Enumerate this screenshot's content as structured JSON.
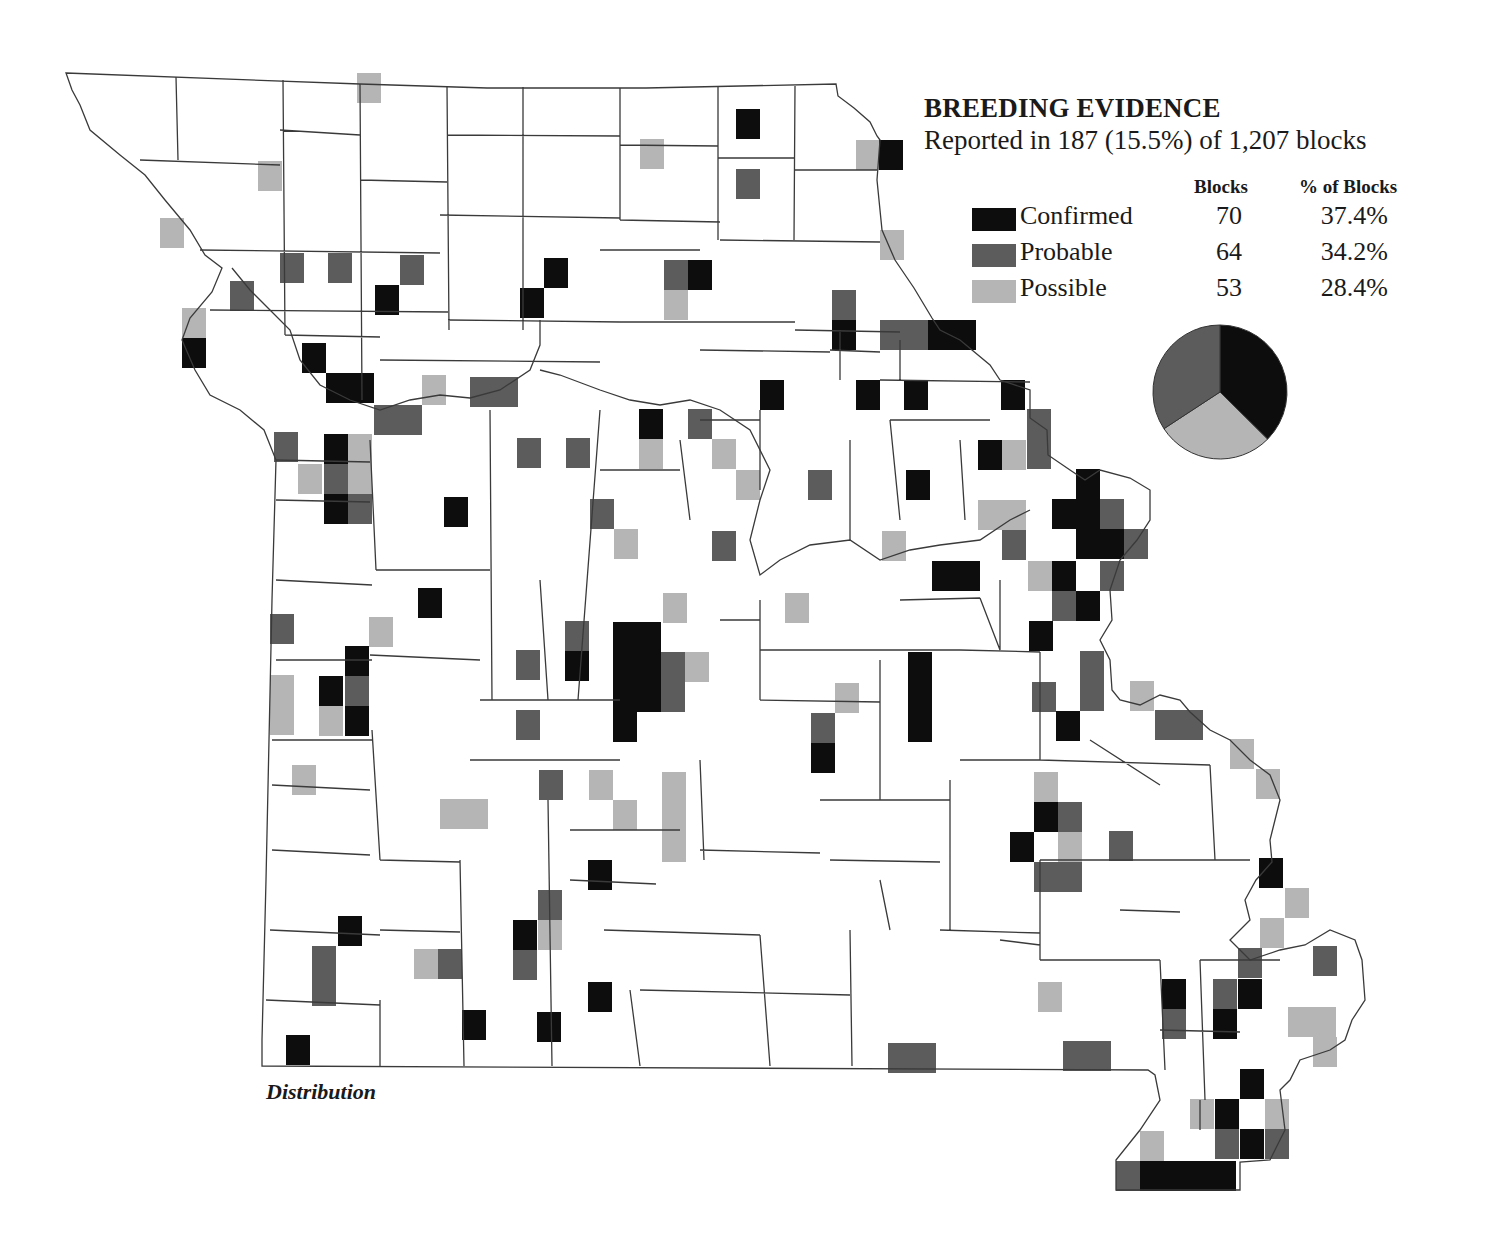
{
  "legend": {
    "title": "BREEDING EVIDENCE",
    "subtitle": "Reported in 187 (15.5%) of 1,207 blocks",
    "col_blocks": "Blocks",
    "col_pct": "% of Blocks",
    "rows": [
      {
        "label": "Confirmed",
        "blocks": "70",
        "pct": "37.4%",
        "color": "#0d0d0d"
      },
      {
        "label": "Probable",
        "blocks": "64",
        "pct": "34.2%",
        "color": "#5c5c5c"
      },
      {
        "label": "Possible",
        "blocks": "53",
        "pct": "28.4%",
        "color": "#b5b5b5"
      }
    ]
  },
  "caption": "Distribution",
  "colors": {
    "confirmed": "#0d0d0d",
    "probable": "#5c5c5c",
    "possible": "#b5b5b5",
    "border": "#3a3a3a"
  },
  "chart_data": {
    "type": "pie",
    "title": "BREEDING EVIDENCE",
    "subtitle": "Reported in 187 (15.5%) of 1,207 blocks",
    "categories": [
      "Confirmed",
      "Probable",
      "Possible"
    ],
    "values": [
      70,
      64,
      53
    ],
    "percentages": [
      37.4,
      34.2,
      28.4
    ],
    "total_blocks_reported": 187,
    "total_blocks": 1207
  },
  "blocks": [
    [
      357,
      73,
      24,
      30,
      "s"
    ],
    [
      736,
      109,
      24,
      30,
      "c"
    ],
    [
      736,
      169,
      24,
      30,
      "p"
    ],
    [
      640,
      139,
      24,
      30,
      "s"
    ],
    [
      856,
      140,
      24,
      30,
      "s"
    ],
    [
      879,
      140,
      24,
      30,
      "c"
    ],
    [
      258,
      161,
      24,
      30,
      "s"
    ],
    [
      160,
      218,
      24,
      30,
      "s"
    ],
    [
      880,
      230,
      24,
      30,
      "s"
    ],
    [
      280,
      253,
      24,
      30,
      "p"
    ],
    [
      328,
      253,
      24,
      30,
      "p"
    ],
    [
      400,
      255,
      24,
      30,
      "p"
    ],
    [
      230,
      281,
      24,
      30,
      "p"
    ],
    [
      375,
      285,
      24,
      30,
      "c"
    ],
    [
      544,
      258,
      24,
      30,
      "c"
    ],
    [
      520,
      288,
      24,
      30,
      "c"
    ],
    [
      664,
      260,
      24,
      30,
      "p"
    ],
    [
      688,
      260,
      24,
      30,
      "c"
    ],
    [
      664,
      290,
      24,
      30,
      "s"
    ],
    [
      832,
      290,
      24,
      30,
      "p"
    ],
    [
      832,
      320,
      24,
      30,
      "c"
    ],
    [
      880,
      320,
      48,
      30,
      "p"
    ],
    [
      928,
      320,
      48,
      30,
      "c"
    ],
    [
      182,
      308,
      24,
      30,
      "s"
    ],
    [
      182,
      338,
      24,
      30,
      "c"
    ],
    [
      302,
      343,
      24,
      30,
      "c"
    ],
    [
      326,
      373,
      48,
      30,
      "c"
    ],
    [
      422,
      375,
      24,
      30,
      "s"
    ],
    [
      470,
      377,
      48,
      30,
      "p"
    ],
    [
      374,
      405,
      48,
      30,
      "p"
    ],
    [
      760,
      380,
      24,
      30,
      "c"
    ],
    [
      856,
      380,
      24,
      30,
      "c"
    ],
    [
      904,
      380,
      24,
      30,
      "c"
    ],
    [
      1001,
      380,
      24,
      30,
      "c"
    ],
    [
      274,
      432,
      24,
      30,
      "p"
    ],
    [
      324,
      434,
      24,
      30,
      "c"
    ],
    [
      348,
      434,
      24,
      30,
      "s"
    ],
    [
      298,
      464,
      24,
      30,
      "s"
    ],
    [
      324,
      464,
      24,
      30,
      "p"
    ],
    [
      348,
      464,
      24,
      30,
      "s"
    ],
    [
      324,
      494,
      24,
      30,
      "c"
    ],
    [
      348,
      494,
      24,
      30,
      "p"
    ],
    [
      517,
      438,
      24,
      30,
      "p"
    ],
    [
      566,
      438,
      24,
      30,
      "p"
    ],
    [
      639,
      409,
      24,
      30,
      "c"
    ],
    [
      639,
      439,
      24,
      30,
      "s"
    ],
    [
      688,
      409,
      24,
      30,
      "p"
    ],
    [
      712,
      439,
      24,
      30,
      "s"
    ],
    [
      736,
      470,
      24,
      30,
      "s"
    ],
    [
      808,
      470,
      24,
      30,
      "p"
    ],
    [
      1027,
      409,
      24,
      60,
      "p"
    ],
    [
      978,
      440,
      24,
      30,
      "c"
    ],
    [
      1002,
      440,
      24,
      30,
      "s"
    ],
    [
      444,
      497,
      24,
      30,
      "c"
    ],
    [
      590,
      499,
      24,
      30,
      "p"
    ],
    [
      614,
      529,
      24,
      30,
      "s"
    ],
    [
      712,
      531,
      24,
      30,
      "p"
    ],
    [
      906,
      470,
      24,
      30,
      "c"
    ],
    [
      978,
      500,
      48,
      30,
      "s"
    ],
    [
      1002,
      530,
      24,
      30,
      "p"
    ],
    [
      882,
      531,
      24,
      30,
      "s"
    ],
    [
      932,
      561,
      48,
      30,
      "c"
    ],
    [
      1076,
      469,
      24,
      30,
      "c"
    ],
    [
      1052,
      499,
      48,
      30,
      "c"
    ],
    [
      1100,
      499,
      24,
      30,
      "p"
    ],
    [
      1076,
      529,
      48,
      30,
      "c"
    ],
    [
      1124,
      529,
      24,
      30,
      "p"
    ],
    [
      1028,
      561,
      24,
      30,
      "s"
    ],
    [
      1052,
      561,
      24,
      30,
      "c"
    ],
    [
      1100,
      561,
      24,
      30,
      "p"
    ],
    [
      1052,
      591,
      24,
      30,
      "p"
    ],
    [
      1076,
      591,
      24,
      30,
      "c"
    ],
    [
      1029,
      621,
      24,
      30,
      "c"
    ],
    [
      785,
      593,
      24,
      30,
      "s"
    ],
    [
      418,
      588,
      24,
      30,
      "c"
    ],
    [
      270,
      614,
      24,
      30,
      "p"
    ],
    [
      369,
      617,
      24,
      30,
      "s"
    ],
    [
      663,
      593,
      24,
      30,
      "s"
    ],
    [
      345,
      646,
      24,
      30,
      "c"
    ],
    [
      319,
      676,
      24,
      30,
      "c"
    ],
    [
      345,
      676,
      24,
      30,
      "p"
    ],
    [
      319,
      706,
      24,
      30,
      "s"
    ],
    [
      345,
      706,
      24,
      30,
      "c"
    ],
    [
      270,
      675,
      24,
      60,
      "s"
    ],
    [
      516,
      650,
      24,
      30,
      "p"
    ],
    [
      565,
      621,
      24,
      30,
      "p"
    ],
    [
      565,
      651,
      24,
      30,
      "c"
    ],
    [
      613,
      622,
      48,
      90,
      "c"
    ],
    [
      613,
      712,
      24,
      30,
      "c"
    ],
    [
      661,
      652,
      24,
      60,
      "p"
    ],
    [
      685,
      652,
      24,
      30,
      "s"
    ],
    [
      516,
      710,
      24,
      30,
      "p"
    ],
    [
      908,
      652,
      24,
      90,
      "c"
    ],
    [
      835,
      683,
      24,
      30,
      "s"
    ],
    [
      811,
      713,
      24,
      30,
      "p"
    ],
    [
      811,
      743,
      24,
      30,
      "c"
    ],
    [
      1080,
      651,
      24,
      60,
      "p"
    ],
    [
      1032,
      682,
      24,
      30,
      "p"
    ],
    [
      1056,
      711,
      24,
      30,
      "c"
    ],
    [
      1130,
      681,
      24,
      30,
      "s"
    ],
    [
      1155,
      710,
      48,
      30,
      "p"
    ],
    [
      1230,
      739,
      24,
      30,
      "s"
    ],
    [
      1256,
      769,
      24,
      30,
      "s"
    ],
    [
      292,
      765,
      24,
      30,
      "s"
    ],
    [
      440,
      799,
      48,
      30,
      "s"
    ],
    [
      539,
      770,
      24,
      30,
      "p"
    ],
    [
      589,
      770,
      24,
      30,
      "s"
    ],
    [
      613,
      800,
      24,
      30,
      "s"
    ],
    [
      662,
      772,
      24,
      90,
      "s"
    ],
    [
      1034,
      772,
      24,
      30,
      "s"
    ],
    [
      1034,
      802,
      24,
      30,
      "c"
    ],
    [
      1058,
      802,
      24,
      30,
      "p"
    ],
    [
      1010,
      832,
      24,
      30,
      "c"
    ],
    [
      1058,
      832,
      24,
      30,
      "s"
    ],
    [
      1034,
      862,
      48,
      30,
      "p"
    ],
    [
      1109,
      831,
      24,
      30,
      "p"
    ],
    [
      588,
      860,
      24,
      30,
      "c"
    ],
    [
      1259,
      858,
      24,
      30,
      "c"
    ],
    [
      1285,
      888,
      24,
      30,
      "s"
    ],
    [
      1260,
      918,
      24,
      30,
      "s"
    ],
    [
      338,
      916,
      24,
      30,
      "c"
    ],
    [
      312,
      946,
      24,
      60,
      "p"
    ],
    [
      414,
      949,
      24,
      30,
      "s"
    ],
    [
      438,
      949,
      24,
      30,
      "p"
    ],
    [
      538,
      890,
      24,
      30,
      "p"
    ],
    [
      513,
      920,
      24,
      30,
      "c"
    ],
    [
      538,
      920,
      24,
      30,
      "s"
    ],
    [
      513,
      950,
      24,
      30,
      "p"
    ],
    [
      1238,
      948,
      24,
      30,
      "p"
    ],
    [
      1313,
      946,
      24,
      30,
      "p"
    ],
    [
      1162,
      979,
      24,
      30,
      "c"
    ],
    [
      1162,
      1009,
      24,
      30,
      "p"
    ],
    [
      1213,
      979,
      24,
      30,
      "p"
    ],
    [
      1238,
      979,
      24,
      30,
      "c"
    ],
    [
      1213,
      1009,
      24,
      30,
      "c"
    ],
    [
      1288,
      1007,
      48,
      30,
      "s"
    ],
    [
      1313,
      1037,
      24,
      30,
      "s"
    ],
    [
      1038,
      982,
      24,
      30,
      "s"
    ],
    [
      588,
      982,
      24,
      30,
      "c"
    ],
    [
      462,
      1010,
      24,
      30,
      "c"
    ],
    [
      537,
      1012,
      24,
      30,
      "c"
    ],
    [
      286,
      1035,
      24,
      30,
      "c"
    ],
    [
      888,
      1043,
      48,
      30,
      "p"
    ],
    [
      1063,
      1041,
      48,
      30,
      "p"
    ],
    [
      1240,
      1069,
      24,
      30,
      "c"
    ],
    [
      1190,
      1099,
      24,
      30,
      "s"
    ],
    [
      1215,
      1099,
      24,
      30,
      "c"
    ],
    [
      1265,
      1099,
      24,
      30,
      "s"
    ],
    [
      1215,
      1129,
      24,
      30,
      "p"
    ],
    [
      1240,
      1129,
      24,
      30,
      "c"
    ],
    [
      1265,
      1129,
      24,
      30,
      "p"
    ],
    [
      1140,
      1131,
      24,
      30,
      "s"
    ],
    [
      1116,
      1161,
      24,
      30,
      "p"
    ],
    [
      1140,
      1161,
      96,
      30,
      "c"
    ]
  ]
}
